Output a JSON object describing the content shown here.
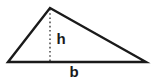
{
  "figure": {
    "kind": "triangle-area-diagram",
    "background_color": "#ffffff",
    "stroke_color": "#1a1a1a",
    "labels": {
      "height": "h",
      "base": "b"
    }
  },
  "chart_data": {
    "type": "diagram",
    "title": "",
    "shape": "triangle",
    "vertices": {
      "apex": {
        "x": 50,
        "y": 8
      },
      "bottom_left": {
        "x": 8,
        "y": 62
      },
      "bottom_right": {
        "x": 146,
        "y": 62
      }
    },
    "altitude": {
      "label": "h",
      "from": {
        "x": 50,
        "y": 8
      },
      "to": {
        "x": 50,
        "y": 62
      },
      "style": "dotted",
      "length_px": 54
    },
    "base": {
      "label": "b",
      "from": {
        "x": 8,
        "y": 62
      },
      "to": {
        "x": 146,
        "y": 62
      },
      "length_px": 138
    },
    "label_positions": {
      "h": {
        "x": 61,
        "y": 44
      },
      "b": {
        "x": 74,
        "y": 77
      }
    },
    "annotations": [
      "h",
      "b"
    ],
    "grid": false,
    "legend": null
  }
}
